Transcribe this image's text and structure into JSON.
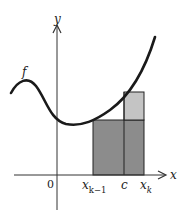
{
  "diagram": {
    "axes": {
      "x_label": "x",
      "y_label": "y",
      "origin_label": "0"
    },
    "curve_label": "f",
    "ticks": [
      {
        "id": "xk_minus_1",
        "base": "x",
        "sub": "k−1"
      },
      {
        "id": "c",
        "base": "c",
        "sub": ""
      },
      {
        "id": "xk",
        "base": "x",
        "sub": "k"
      }
    ],
    "colors": {
      "dark_rect": "#8c8c8c",
      "light_rect": "#c4c4c4",
      "curve": "#1a1a1a",
      "axis": "#333333"
    }
  }
}
